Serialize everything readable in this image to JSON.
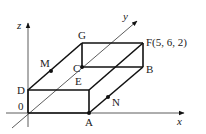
{
  "figure": {
    "axes": {
      "x": "x",
      "y": "y",
      "z": "z",
      "origin": "0"
    },
    "vertices": {
      "A": "A",
      "B": "B",
      "C": "C",
      "D": "D",
      "E": "E",
      "F": "F(5, 6, 2)",
      "G": "G"
    },
    "points": {
      "M": "M",
      "N": "N"
    },
    "colors": {
      "line": "#111111",
      "axis": "#333333",
      "text": "#222222"
    }
  }
}
